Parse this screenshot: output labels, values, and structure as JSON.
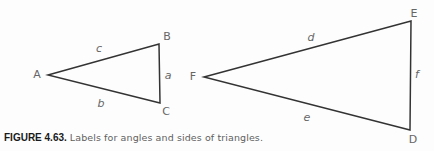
{
  "figure": {
    "caption": {
      "label": "FIGURE 4.63.",
      "text": "Labels for angles and sides of triangles."
    },
    "triangles": [
      {
        "name": "triangle ABC",
        "vertex_labels": [
          "A",
          "B",
          "C"
        ],
        "side_labels": [
          "c",
          "a",
          "b"
        ]
      },
      {
        "name": "triangle FED",
        "vertex_labels": [
          "F",
          "E",
          "D"
        ],
        "side_labels": [
          "d",
          "f",
          "e"
        ]
      }
    ],
    "colors": {
      "background": "#fdfdfd",
      "line": "#333333",
      "diagram_label": "#666666",
      "caption_label": "#1a1a1a",
      "caption_text": "#5f5f5f"
    }
  }
}
